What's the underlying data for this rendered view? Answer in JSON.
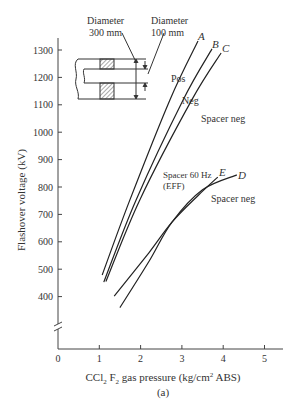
{
  "chart_data": {
    "type": "line",
    "title": "",
    "caption": "(a)",
    "xlabel": "CCl2 F2 gas pressure (kg/cm2 ABS)",
    "xlabel_parts": {
      "pre": "CCl",
      "sub1": "2",
      "mid": " F",
      "sub2": "2",
      "post1": " gas pressure (kg/cm",
      "sup": "2",
      "post2": " ABS)"
    },
    "ylabel": "Flashover voltage (kV)",
    "xlim": [
      0,
      5.4
    ],
    "ylim_display": [
      400,
      1300
    ],
    "y_axis_break": true,
    "grid": false,
    "x_ticks": [
      "0",
      "1",
      "2",
      "3",
      "4",
      "5"
    ],
    "y_ticks": [
      "400",
      "500",
      "600",
      "700",
      "800",
      "900",
      "1000",
      "1100",
      "1200",
      "1300"
    ],
    "series": [
      {
        "name": "A",
        "label": "Pos",
        "points": [
          [
            1.07,
            479
          ],
          [
            1.74,
            753
          ],
          [
            2.71,
            1118
          ],
          [
            3.39,
            1333
          ]
        ]
      },
      {
        "name": "B",
        "label": "Neg",
        "points": [
          [
            1.11,
            453
          ],
          [
            1.89,
            753
          ],
          [
            3.03,
            1118
          ],
          [
            3.73,
            1304
          ]
        ]
      },
      {
        "name": "C",
        "label": "Spacer neg",
        "points": [
          [
            1.16,
            455
          ],
          [
            1.98,
            753
          ],
          [
            3.24,
            1118
          ],
          [
            3.95,
            1289
          ]
        ]
      },
      {
        "name": "E",
        "label": "Spacer 60 Hz (EFF)",
        "points": [
          [
            1.36,
            402
          ],
          [
            2.2,
            560
          ],
          [
            2.76,
            672
          ],
          [
            3.4,
            770
          ],
          [
            3.87,
            836
          ]
        ]
      },
      {
        "name": "D",
        "label": "Spacer neg",
        "points": [
          [
            1.5,
            360
          ],
          [
            2.2,
            528
          ],
          [
            2.76,
            672
          ],
          [
            3.5,
            790
          ],
          [
            4.33,
            844
          ]
        ]
      }
    ],
    "annotations": [
      {
        "text": "Diameter",
        "sub": "300 mm"
      },
      {
        "text": "Diameter",
        "sub": "100 mm"
      }
    ]
  },
  "labels": {
    "A": "A",
    "B": "B",
    "C": "C",
    "D": "D",
    "E": "E",
    "pos": "Pos",
    "neg": "Neg",
    "spacer_neg_upper": "Spacer neg",
    "spacer_60hz": "Spacer 60 Hz",
    "eff": "(EFF)",
    "spacer_neg_lower": "Spacer neg",
    "diam1_line1": "Diameter",
    "diam1_line2": "300 mm",
    "diam2_line1": "Diameter",
    "diam2_line2": "100 mm"
  }
}
